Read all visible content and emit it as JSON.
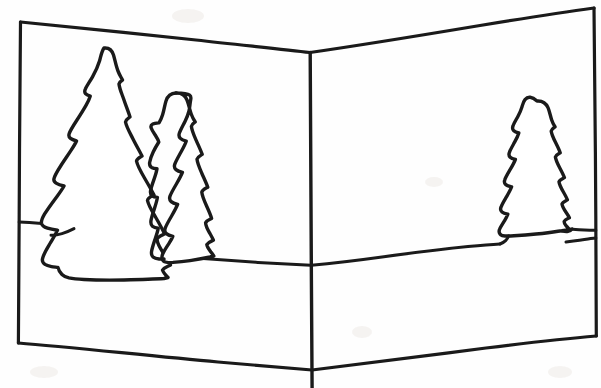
{
  "document": {
    "title": "Hand-drawn greeting card sketch",
    "medium": "pen-on-paper line drawing",
    "background_color": "#fefefe",
    "ink_color": "#1a1a1a",
    "width": 601,
    "height": 388
  },
  "scene": {
    "subject": "open folded greeting card showing a winter forest landscape",
    "panels": [
      {
        "name": "left-panel",
        "label": "Left panel",
        "contents": "two evergreen trees and horizon"
      },
      {
        "name": "right-panel",
        "label": "Right panel",
        "contents": "one evergreen tree and horizon"
      }
    ],
    "fold": {
      "label": "Center fold",
      "apex_x": 310,
      "apex_y": 52,
      "bottom_x": 312,
      "bottom_y": 388
    },
    "card_outline": {
      "label": "Card outline",
      "top_left": "20,22",
      "top_center": "310,52",
      "top_right": "594,8",
      "bottom_right": "596,336",
      "bottom_center": "312,370",
      "bottom_left": "18,343"
    },
    "horizon": {
      "label": "Horizon line",
      "left_y": 222,
      "center_y": 265,
      "right_y": 238
    },
    "trees": [
      {
        "name": "tree-large-left",
        "label": "Large fir tree",
        "panel": "left-panel",
        "peak_x": 105,
        "peak_y": 48,
        "base_y": 278,
        "height_px": 230
      },
      {
        "name": "tree-medium-left",
        "label": "Medium fir tree",
        "panel": "left-panel",
        "peak_x": 177,
        "peak_y": 93,
        "base_y": 272,
        "height_px": 179
      },
      {
        "name": "tree-small-right",
        "label": "Small fir tree",
        "panel": "right-panel",
        "peak_x": 538,
        "peak_y": 101,
        "base_y": 247,
        "height_px": 146
      }
    ]
  }
}
